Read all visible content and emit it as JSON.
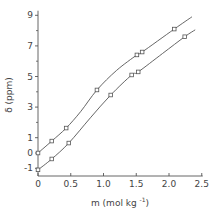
{
  "chart_data": {
    "type": "line",
    "title": "",
    "xlabel": "m (mol kg",
    "xlabel_sup": "-1",
    "xlabel_end": ")",
    "ylabel": "δ (ppm)",
    "xlim": [
      0,
      2.5
    ],
    "ylim": [
      -1.2,
      9.3
    ],
    "x_ticks": [
      0,
      0.5,
      1.0,
      1.5,
      2.0,
      2.5
    ],
    "x_tick_labels": [
      "0",
      "0.5",
      "1.0",
      "1.5",
      "2.0",
      "2.5"
    ],
    "y_ticks": [
      -1,
      0,
      1,
      3,
      5,
      7,
      9
    ],
    "y_tick_labels": [
      "-1",
      "0",
      "1",
      "3",
      "5",
      "7",
      "9"
    ],
    "y_minor_ticks": [
      2,
      4,
      6,
      8
    ],
    "grid": false,
    "legend": null,
    "marker": "open-square",
    "series": [
      {
        "name": "upper",
        "points": [
          [
            0.0,
            0.0
          ],
          [
            0.21,
            0.78
          ],
          [
            0.43,
            1.63
          ],
          [
            0.9,
            4.12
          ],
          [
            1.51,
            6.41
          ],
          [
            1.59,
            6.6
          ],
          [
            2.08,
            8.1
          ]
        ],
        "curve": [
          [
            0.0,
            0.0
          ],
          [
            0.21,
            0.78
          ],
          [
            0.43,
            1.63
          ],
          [
            0.65,
            2.7
          ],
          [
            0.9,
            4.12
          ],
          [
            1.2,
            5.4
          ],
          [
            1.51,
            6.41
          ],
          [
            1.59,
            6.6
          ],
          [
            2.08,
            8.1
          ],
          [
            2.35,
            8.9
          ]
        ]
      },
      {
        "name": "lower",
        "points": [
          [
            0.0,
            -1.1
          ],
          [
            0.21,
            -0.39
          ],
          [
            0.47,
            0.65
          ],
          [
            1.11,
            3.79
          ],
          [
            1.43,
            5.1
          ],
          [
            1.53,
            5.3
          ],
          [
            2.24,
            7.6
          ]
        ],
        "curve": [
          [
            0.0,
            -1.1
          ],
          [
            0.21,
            -0.39
          ],
          [
            0.47,
            0.65
          ],
          [
            0.8,
            2.3
          ],
          [
            1.11,
            3.79
          ],
          [
            1.43,
            5.1
          ],
          [
            1.53,
            5.3
          ],
          [
            1.9,
            6.5
          ],
          [
            2.24,
            7.6
          ],
          [
            2.4,
            8.05
          ]
        ]
      }
    ]
  },
  "colors": {
    "line": "#555555",
    "axis": "#555555",
    "text": "#444444",
    "background": "#ffffff"
  }
}
